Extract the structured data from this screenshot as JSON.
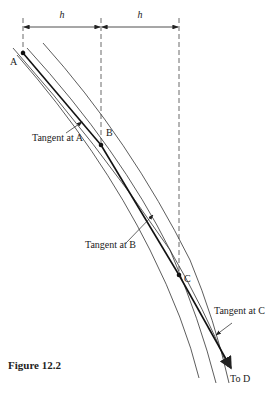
{
  "figure": {
    "caption": "Figure 12.2",
    "dimension_labels": [
      "h",
      "h"
    ],
    "points": [
      {
        "name": "A",
        "x": 23,
        "y": 53
      },
      {
        "name": "B",
        "x": 101,
        "y": 145
      },
      {
        "name": "C",
        "x": 179,
        "y": 275
      }
    ],
    "tangent_labels": {
      "a": "Tangent at A",
      "b": "Tangent at B",
      "c": "Tangent at C"
    },
    "end_label": "To D",
    "colors": {
      "line": "#222222",
      "background": "#ffffff"
    }
  }
}
